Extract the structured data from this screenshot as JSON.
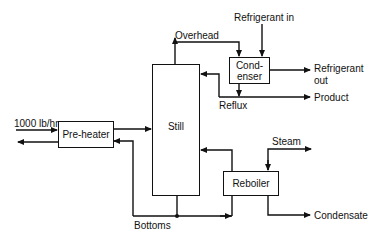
{
  "diagram": {
    "type": "process-flow",
    "units": {
      "preheater": "Pre-heater",
      "still": "Still",
      "condenser_line1": "Cond-",
      "condenser_line2": "enser",
      "reboiler": "Reboiler"
    },
    "streams": {
      "feed": "1000 lb/hr",
      "overhead": "Overhead",
      "refrigerant_in": "Refrigerant in",
      "refrigerant_out_line1": "Refrigerant",
      "refrigerant_out_line2": "out",
      "reflux": "Reflux",
      "product": "Product",
      "steam": "Steam",
      "bottoms": "Bottoms",
      "condensate": "Condensate"
    },
    "colors": {
      "line": "#111111",
      "background": "#ffffff"
    }
  }
}
